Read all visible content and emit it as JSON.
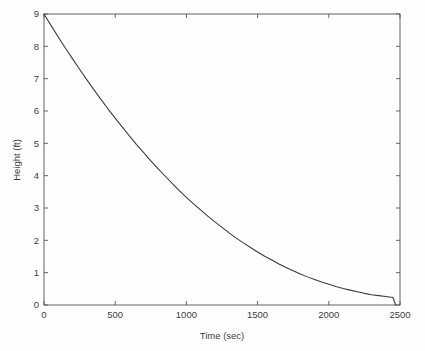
{
  "figure": {
    "background_color": "#fffeff",
    "axes_color": "#555555",
    "curve_color": "#3a3a3a",
    "text_color": "#3d3d3d"
  },
  "chart_data": {
    "type": "line",
    "title": "",
    "xlabel": "Time (sec)",
    "ylabel": "Height (ft)",
    "xlim": [
      0,
      2500
    ],
    "ylim": [
      0,
      9
    ],
    "xticks": [
      0,
      500,
      1000,
      1500,
      2000,
      2500
    ],
    "xtick_labels": [
      "0",
      "500",
      "1000",
      "1500",
      "2000",
      "2500"
    ],
    "yticks": [
      0,
      1,
      2,
      3,
      4,
      5,
      6,
      7,
      8,
      9
    ],
    "ytick_labels": [
      "0",
      "1",
      "2",
      "3",
      "4",
      "5",
      "6",
      "7",
      "8",
      "9"
    ],
    "grid": false,
    "legend": false,
    "legend_position": "none",
    "box": true,
    "series": [
      {
        "name": "Height",
        "x": [
          0,
          50,
          100,
          150,
          200,
          250,
          300,
          350,
          400,
          450,
          500,
          550,
          600,
          650,
          700,
          750,
          800,
          850,
          900,
          950,
          1000,
          1050,
          1100,
          1150,
          1200,
          1250,
          1300,
          1350,
          1400,
          1450,
          1500,
          1550,
          1600,
          1650,
          1700,
          1750,
          1800,
          1850,
          1900,
          1950,
          2000,
          2050,
          2100,
          2150,
          2200,
          2250,
          2300,
          2350,
          2400,
          2450,
          2470
        ],
        "y": [
          9.0,
          8.64,
          8.29,
          7.95,
          7.62,
          7.29,
          6.97,
          6.66,
          6.36,
          6.06,
          5.78,
          5.5,
          5.23,
          4.96,
          4.71,
          4.46,
          4.22,
          3.99,
          3.76,
          3.54,
          3.33,
          3.13,
          2.94,
          2.75,
          2.57,
          2.4,
          2.23,
          2.07,
          1.92,
          1.78,
          1.64,
          1.51,
          1.39,
          1.27,
          1.16,
          1.06,
          0.96,
          0.87,
          0.79,
          0.71,
          0.64,
          0.57,
          0.51,
          0.46,
          0.41,
          0.36,
          0.32,
          0.29,
          0.26,
          0.23,
          0.0
        ]
      }
    ],
    "annotations": []
  }
}
